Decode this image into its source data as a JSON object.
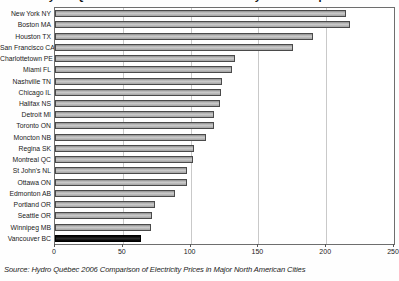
{
  "chart_data": {
    "type": "bar",
    "orientation": "horizontal",
    "title": "Hydro Quebec 2006 Residential Electricity Price Comparison",
    "categories": [
      "New York NY",
      "Boston MA",
      "Houston TX",
      "San Francisco CA",
      "Charlottetown PE",
      "Miami FL",
      "Nashville TN",
      "Chicago IL",
      "Halifax NS",
      "Detroit MI",
      "Toronto ON",
      "Moncton NB",
      "Regina SK",
      "Montreal QC",
      "St John's NL",
      "Ottawa ON",
      "Edmonton AB",
      "Portland OR",
      "Seattle OR",
      "Winnipeg MB",
      "Vancouver BC"
    ],
    "values": [
      213,
      216,
      189,
      174,
      131,
      129,
      122,
      121,
      120,
      116,
      116,
      110,
      101,
      100,
      96,
      96,
      87,
      72,
      70,
      69,
      62
    ],
    "highlight_category": "Vancouver BC",
    "xlabel": "",
    "ylabel": "",
    "xlim": [
      0,
      250
    ],
    "x_ticks": [
      0,
      50,
      100,
      150,
      200,
      250
    ],
    "grid": true,
    "legend": "none",
    "colors": {
      "bar_fill": "#b3b3b3",
      "bar_border": "#4a4a4a",
      "highlight_fill": "#111111",
      "gridline": "#c9c9c9",
      "frame": "#6e6e6e",
      "background": "#ffffff"
    }
  },
  "source_note": "Source: Hydro Québec 2006 Comparison of Electricity Prices in Major North American Cities"
}
